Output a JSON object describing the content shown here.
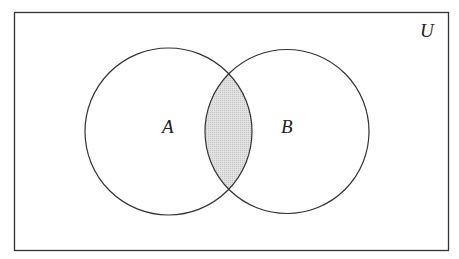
{
  "diagram": {
    "type": "venn",
    "universe_label": "U",
    "sets": [
      {
        "label": "A"
      },
      {
        "label": "B"
      }
    ],
    "shaded_region": "A ∩ B",
    "colors": {
      "stroke": "#333333",
      "shade": "#d6d6d6",
      "background": "#ffffff"
    }
  }
}
